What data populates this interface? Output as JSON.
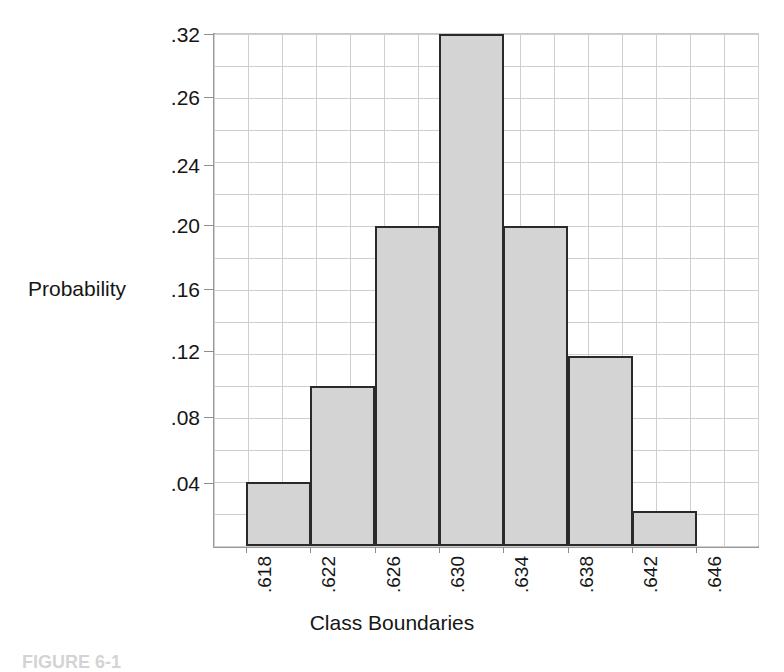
{
  "figure": {
    "caption": "FIGURE 6-1",
    "background_color": "#ffffff"
  },
  "axes": {
    "y_title": "Probability",
    "x_title": "Class Boundaries",
    "bar_fill_color": "#d4d4d4",
    "bar_edge_color": "#2a2a2a",
    "grid_color": "#cfcfcf",
    "axis_color": "#9a9a9a"
  },
  "chart_data": {
    "type": "bar",
    "title": "",
    "subtitle": "",
    "xlabel": "Class Boundaries",
    "ylabel": "Probability",
    "grid": true,
    "legend": null,
    "legend_position": "none",
    "note": "Histogram of probability by class boundaries; bars span consecutive class intervals.",
    "bin_edges": [
      0.618,
      0.622,
      0.626,
      0.63,
      0.634,
      0.638,
      0.642,
      0.646
    ],
    "x_tick_labels": [
      ".618",
      ".622",
      ".626",
      ".630",
      ".634",
      ".638",
      ".642",
      ".646"
    ],
    "x_tick_values": [
      0.618,
      0.622,
      0.626,
      0.63,
      0.634,
      0.638,
      0.642,
      0.646
    ],
    "xlim": [
      0.6165,
      0.6485
    ],
    "categories": [
      ".618-.622",
      ".622-.626",
      ".626-.630",
      ".630-.634",
      ".634-.638",
      ".638-.642",
      ".642-.646"
    ],
    "values": [
      0.04,
      0.1,
      0.2,
      0.32,
      0.2,
      0.119,
      0.022
    ],
    "value_labels": [
      ".04",
      ".10",
      ".20",
      ".32",
      ".20",
      ".12",
      ".02"
    ],
    "y_tick_labels": [
      ".32",
      ".26",
      ".24",
      ".20",
      ".16",
      ".12",
      ".08",
      ".04"
    ],
    "y_tick_values": [
      0.32,
      0.26,
      0.24,
      0.2,
      0.16,
      0.12,
      0.08,
      0.04
    ],
    "ylim": [
      0,
      0.32
    ]
  }
}
